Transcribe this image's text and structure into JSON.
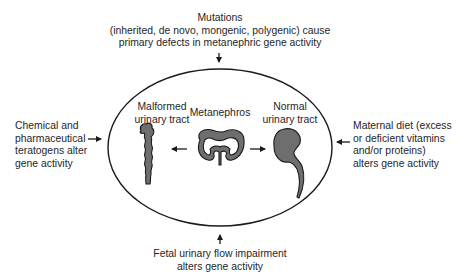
{
  "diagram": {
    "colors": {
      "stroke": "#1a1a1a",
      "fill": "#6e6e6e",
      "text": "#262626",
      "background": "#ffffff"
    },
    "top_factor": {
      "lines": [
        "Mutations",
        "(inherited, de novo, mongenic, polygenic) cause",
        "primary defects in metanephric gene activity"
      ],
      "arrow_direction": "down"
    },
    "left_factor": {
      "lines": [
        "Chemical and",
        "pharmaceutical",
        "teratogens alter",
        "gene activity"
      ],
      "arrow_direction": "right"
    },
    "right_factor": {
      "lines": [
        "Maternal diet (excess",
        "or deficient vitamins",
        "and/or proteins)",
        "alters gene activity"
      ],
      "arrow_direction": "left"
    },
    "bottom_factor": {
      "lines": [
        "Fetal urinary flow impairment",
        "alters gene activity"
      ],
      "arrow_direction": "up"
    },
    "center": {
      "malformed": {
        "lines": [
          "Malformed",
          "urinary tract"
        ],
        "icon": "malformed-urinary-tract-icon"
      },
      "metanephros": {
        "lines": [
          "Metanephros"
        ],
        "icon": "metanephros-icon"
      },
      "normal": {
        "lines": [
          "Normal",
          "urinary tract"
        ],
        "icon": "normal-kidney-icon"
      },
      "arrow_to_malformed": "left",
      "arrow_to_normal": "right"
    }
  }
}
